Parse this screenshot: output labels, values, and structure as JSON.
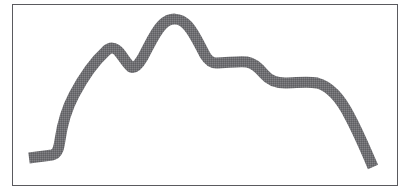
{
  "figure": {
    "title": "Hand-drawn terrain profile outline",
    "kind": "line-drawing",
    "background_color": "#ffffff",
    "frame": {
      "label": "rectangular image border",
      "color": "#5a5a5e",
      "line_width": 1,
      "x": 12,
      "y": 4,
      "width": 386,
      "height": 182
    },
    "stroke": {
      "label": "hill silhouette stroke",
      "color": "#6f6f72",
      "texture": "dithered halftone gray",
      "line_width": 11,
      "line_cap": "butt",
      "line_join": "round",
      "fill": "none"
    },
    "path": {
      "description": "Thick gray freehand curve: low flat tail at left, bend upward, long concave rise, small first peak, dip, large rounded summit, sharp drop to a flat shoulder, gentle S-shaped descent, then a steep convex plunge ending low at the right.",
      "svg_d": "M 29 158 L 52 155 C 58 154 59 147 60 140 C 62 126 66 110 74 95 C 84 76 96 60 106 51 C 110 47 115 47 119 52 C 124 58 127 64 131 67 C 135 69 139 64 143 57 C 149 46 155 32 162 25 C 170 17 180 17 188 26 C 195 34 200 46 205 55 C 208 60 211 63 216 63 C 227 63 238 61 247 62 C 254 63 259 68 264 74 C 269 80 276 83 285 83 C 296 83 307 81 317 83 C 329 86 340 97 350 117 C 359 134 367 153 373 167",
      "key_points": [
        {
          "name": "left-tail-start",
          "x": 29,
          "y": 158
        },
        {
          "name": "left-tail-bend",
          "x": 55,
          "y": 152
        },
        {
          "name": "rise-midpoint",
          "x": 75,
          "y": 94
        },
        {
          "name": "first-peak",
          "x": 110,
          "y": 48
        },
        {
          "name": "saddle-dip",
          "x": 132,
          "y": 67
        },
        {
          "name": "main-summit-left",
          "x": 162,
          "y": 24
        },
        {
          "name": "main-summit-right",
          "x": 188,
          "y": 26
        },
        {
          "name": "shoulder-step",
          "x": 213,
          "y": 62
        },
        {
          "name": "shoulder-plateau-end",
          "x": 248,
          "y": 62
        },
        {
          "name": "lower-plateau",
          "x": 285,
          "y": 83
        },
        {
          "name": "descent-knee",
          "x": 322,
          "y": 86
        },
        {
          "name": "right-tail-end",
          "x": 373,
          "y": 167
        }
      ]
    }
  }
}
